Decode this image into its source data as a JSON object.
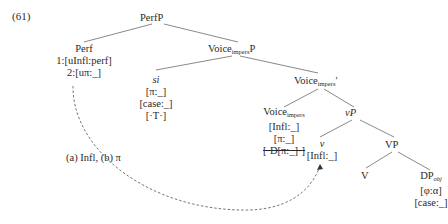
{
  "example_number": "(61)",
  "nodes": {
    "perfP": "PerfP",
    "perf": {
      "label": "Perf",
      "f1": "1:[uInfl:perf]",
      "f2": "2:[uπ:_]"
    },
    "voiceP": {
      "base": "Voice",
      "sub": "impers",
      "tail": "P"
    },
    "si": {
      "label": "si",
      "f1": "[π:_]",
      "f2": "[case:_]",
      "f3": "[·T·]"
    },
    "voiceBar": {
      "base": "Voice",
      "sub": "impers",
      "tail": "′"
    },
    "voiceHead": {
      "base": "Voice",
      "sub": "impers",
      "f1": "[Infl:_]",
      "f2": "[π:_]",
      "f3": "[·D[π:_]·]"
    },
    "vP": {
      "label": "vP"
    },
    "v": {
      "label": "v",
      "f1": "[Infl:_]"
    },
    "VP": "VP",
    "V": "V",
    "DPobj": {
      "base": "DP",
      "sub": "obj",
      "f1": "[φ:α]",
      "f2": "[case:_]"
    }
  },
  "arrow_label": "(a) Infl, (b) π"
}
